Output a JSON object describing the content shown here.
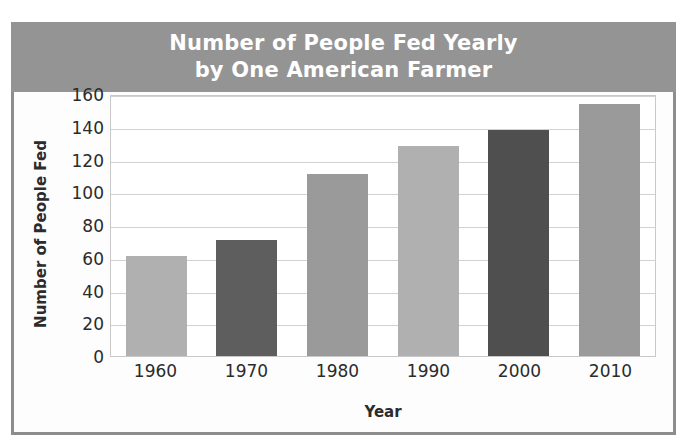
{
  "chart_data": {
    "type": "bar",
    "title": "Number of People Fed Yearly by One American Farmer",
    "title_lines": [
      "Number of People Fed Yearly",
      "by One American Farmer"
    ],
    "xlabel": "Year",
    "ylabel": "Number of People Fed",
    "categories": [
      "1960",
      "1970",
      "1980",
      "1990",
      "2000",
      "2010"
    ],
    "values": [
      61,
      71,
      111,
      128,
      138,
      154
    ],
    "bar_colors": [
      "#b0b0b0",
      "#5e5e5e",
      "#9a9a9a",
      "#b0b0b0",
      "#4f4f4f",
      "#9a9a9a"
    ],
    "ylim": [
      0,
      160
    ],
    "ytick_values": [
      160,
      140,
      120,
      100,
      80,
      60,
      40,
      20,
      0
    ],
    "ytick_labels": [
      "160",
      "140",
      "120",
      "100",
      "80",
      "60",
      "40",
      "20",
      "0"
    ],
    "grid": true,
    "legend": null
  },
  "style": {
    "banner_color": "#949494",
    "frame_color": "#8d8d8d",
    "title_text_color": "#ffffff",
    "grid_color": "#d2d2d2",
    "plot_background": "#ffffff",
    "axis_text_color": "#2b2b2b"
  }
}
